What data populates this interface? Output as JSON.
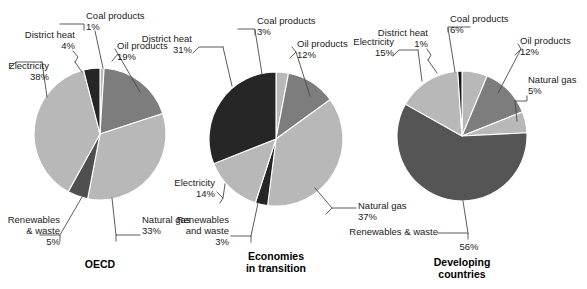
{
  "figure": {
    "background": "#ffffff",
    "text_color": "#1a1a1a",
    "leader_color": "#4a4a4a"
  },
  "palette": {
    "coal": "#b8b8b8",
    "oil": "#7d7d7d",
    "natural_gas": "#b8b8b8",
    "renewables": "#4f4f4f",
    "electricity": "#b8b8b8",
    "district_heat": "#262626",
    "renewables_big": "#555555"
  },
  "chart_data": [
    {
      "type": "pie",
      "title": "OECD",
      "caption_lines": [
        "OECD"
      ],
      "center": [
        100,
        134
      ],
      "radius": 66,
      "start_angle": -90,
      "categories": [
        "Coal products",
        "Oil products",
        "Natural gas",
        "Renewables & waste",
        "Electricity",
        "District heat"
      ],
      "values": [
        1,
        19,
        33,
        5,
        38,
        4
      ],
      "colors": [
        "#b8b8b8",
        "#7d7d7d",
        "#b8b8b8",
        "#4f4f4f",
        "#b8b8b8",
        "#262626"
      ],
      "labels": [
        {
          "name": "Coal products",
          "pct": "1%",
          "text": "Coal products"
        },
        {
          "name": "Oil products",
          "pct": "19%",
          "text": "Oil products"
        },
        {
          "name": "Natural gas",
          "pct": "33%",
          "text": "Natural gas"
        },
        {
          "name": "Renewables & waste",
          "pct": "5%",
          "text": "Renewables\n& waste"
        },
        {
          "name": "Electricity",
          "pct": "38%",
          "text": "Electricity"
        },
        {
          "name": "District heat",
          "pct": "4%",
          "text": "District heat"
        }
      ]
    },
    {
      "type": "pie",
      "title": "Economies in transition",
      "caption_lines": [
        "Economies",
        "in transition"
      ],
      "center": [
        276,
        139
      ],
      "radius": 67,
      "start_angle": -90,
      "categories": [
        "Coal products",
        "Oil products",
        "Natural gas",
        "Renewables and waste",
        "Electricity",
        "District heat"
      ],
      "values": [
        3,
        12,
        37,
        3,
        14,
        31
      ],
      "colors": [
        "#b8b8b8",
        "#7d7d7d",
        "#b8b8b8",
        "#262626",
        "#b8b8b8",
        "#262626"
      ],
      "labels": [
        {
          "name": "Coal products",
          "pct": "3%",
          "text": "Coal products"
        },
        {
          "name": "Oil products",
          "pct": "12%",
          "text": "Oil products"
        },
        {
          "name": "Natural gas",
          "pct": "37%",
          "text": "Natural gas"
        },
        {
          "name": "Renewables and waste",
          "pct": "3%",
          "text": "Renewables\nand waste"
        },
        {
          "name": "Electricity",
          "pct": "14%",
          "text": "Electricity"
        },
        {
          "name": "District heat",
          "pct": "31%",
          "text": "District heat"
        }
      ]
    },
    {
      "type": "pie",
      "title": "Developing countries",
      "caption_lines": [
        "Developing",
        "countries"
      ],
      "center": [
        462,
        136
      ],
      "radius": 65,
      "start_angle": -90,
      "categories": [
        "Coal products",
        "Oil products",
        "Natural gas",
        "Renewables & waste",
        "Electricity",
        "District heat"
      ],
      "values": [
        6,
        12,
        5,
        56,
        15,
        1
      ],
      "colors": [
        "#b8b8b8",
        "#7d7d7d",
        "#b8b8b8",
        "#555555",
        "#b8b8b8",
        "#151515"
      ],
      "labels": [
        {
          "name": "Coal products",
          "pct": "6%",
          "text": "Coal products"
        },
        {
          "name": "Oil products",
          "pct": "12%",
          "text": "Oil products"
        },
        {
          "name": "Natural gas",
          "pct": "5%",
          "text": "Natural gas"
        },
        {
          "name": "Renewables & waste",
          "pct": "56%",
          "text": "Renewables & waste"
        },
        {
          "name": "Electricity",
          "pct": "15%",
          "text": "Electricity"
        },
        {
          "name": "District heat",
          "pct": "1%",
          "text": "District heat"
        }
      ]
    }
  ],
  "labels": {
    "p1": {
      "coal": "Coal products",
      "coal_pct": "1%",
      "district": "District heat",
      "district_pct": "4%",
      "oil": "Oil products",
      "oil_pct": "19%",
      "electricity": "Electricity",
      "electricity_pct": "38%",
      "renew_l1": "Renewables",
      "renew_l2": "& waste",
      "renew_pct": "5%",
      "gas": "Natural gas",
      "gas_pct": "33%",
      "caption": "OECD"
    },
    "p2": {
      "coal": "Coal products",
      "coal_pct": "3%",
      "district": "District heat",
      "district_pct": "31%",
      "oil": "Oil products",
      "oil_pct": "12%",
      "electricity": "Electricity",
      "electricity_pct": "14%",
      "renew_l1": "Renewables",
      "renew_l2": "and waste",
      "renew_pct": "3%",
      "gas": "Natural gas",
      "gas_pct": "37%",
      "caption_l1": "Economies",
      "caption_l2": "in transition"
    },
    "p3": {
      "coal": "Coal products",
      "coal_pct": "6%",
      "district": "District heat",
      "district_pct": "1%",
      "oil": "Oil products",
      "oil_pct": "12%",
      "electricity": "Electricity",
      "electricity_pct": "15%",
      "renew": "Renewables & waste",
      "renew_pct": "56%",
      "gas": "Natural gas",
      "gas_pct": "5%",
      "caption_l1": "Developing",
      "caption_l2": "countries"
    }
  }
}
